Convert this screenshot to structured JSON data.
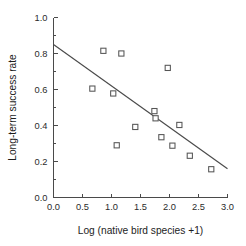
{
  "figure": {
    "background_color": "#ffffff",
    "axis_color": "#4a4a4a",
    "marker_edge_color": "#555555",
    "marker_fill_color": "#ffffff",
    "line_color": "#4a4a4a"
  },
  "chart_data": {
    "type": "scatter",
    "title": "",
    "subtitle": "",
    "xlabel": "Log (native bird species +1)",
    "ylabel": "Long-term success rate",
    "xlim": [
      0.0,
      3.0
    ],
    "ylim": [
      0.0,
      1.0
    ],
    "xticks": [
      0.0,
      0.5,
      1.0,
      1.5,
      2.0,
      2.5,
      3.0
    ],
    "yticks": [
      0.0,
      0.2,
      0.4,
      0.6,
      0.8,
      1.0
    ],
    "xtick_labels": [
      "0.0",
      "0.5",
      "1.0",
      "1.5",
      "2.0",
      "2.5",
      "3.0"
    ],
    "ytick_labels": [
      "0.0",
      "0.2",
      "0.4",
      "0.6",
      "0.8",
      "1.0"
    ],
    "grid": false,
    "legend": null,
    "legend_position": "none",
    "marker_shape": "open-square",
    "points": [
      {
        "x": 0.67,
        "y": 0.605
      },
      {
        "x": 0.86,
        "y": 0.815
      },
      {
        "x": 1.03,
        "y": 0.578
      },
      {
        "x": 1.09,
        "y": 0.29
      },
      {
        "x": 1.17,
        "y": 0.8
      },
      {
        "x": 1.41,
        "y": 0.392
      },
      {
        "x": 1.74,
        "y": 0.48
      },
      {
        "x": 1.76,
        "y": 0.44
      },
      {
        "x": 1.86,
        "y": 0.335
      },
      {
        "x": 1.97,
        "y": 0.72
      },
      {
        "x": 2.05,
        "y": 0.288
      },
      {
        "x": 2.17,
        "y": 0.403
      },
      {
        "x": 2.35,
        "y": 0.232
      },
      {
        "x": 2.72,
        "y": 0.157
      }
    ],
    "trendline": {
      "label": "",
      "x_start": 0.0,
      "y_start": 0.85,
      "x_end": 3.0,
      "y_end": 0.16
    }
  }
}
